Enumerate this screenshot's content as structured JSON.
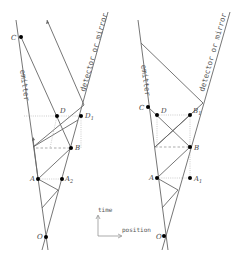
{
  "diagrams": [
    {
      "id": "left",
      "line_labels": {
        "emitter": "emitter",
        "detector": "detector or mirror"
      },
      "points": {
        "C": "C",
        "D": "D",
        "D1": "D",
        "D1_sub": "1",
        "B": "B",
        "A": "A",
        "A1": "A",
        "A1_sub": "2",
        "O": "O"
      }
    },
    {
      "id": "right",
      "line_labels": {
        "emitter": "emitter",
        "detector": "detector or mirror"
      },
      "points": {
        "C": "C",
        "D": "D",
        "D1": "B",
        "D1_sub": "1",
        "B": "B",
        "A": "A",
        "A1": "A",
        "A1_sub": "1",
        "O": "O"
      }
    }
  ],
  "axes": {
    "time": "time",
    "position": "position"
  }
}
